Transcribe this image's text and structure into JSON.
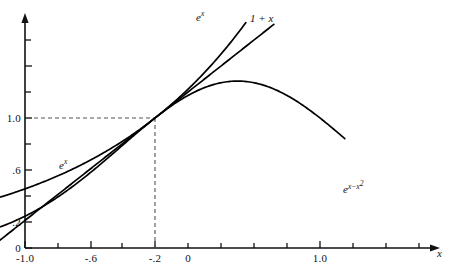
{
  "figure": {
    "background_color": "#ffffff",
    "axis_color": "#111111",
    "curve_color": "#000000",
    "guide_color": "#555555",
    "width": 451,
    "height": 272
  },
  "axes": {
    "x_axis_name": "x",
    "y_axis_name": "",
    "x_tick_labels": [
      "-1.0",
      "-.6",
      "-.2",
      "0",
      "1.0"
    ],
    "x_tick_values": [
      -1.0,
      -0.6,
      -0.2,
      0,
      1.0
    ],
    "x_minor_tick_values": [
      -0.8,
      -0.4,
      0.2,
      0.4,
      0.6,
      0.8,
      1.2,
      1.4
    ],
    "y_tick_labels": [
      "0",
      ".2",
      ".6",
      "1.0"
    ],
    "y_tick_values": [
      0,
      0.2,
      0.6,
      1.0
    ],
    "y_minor_tick_values": [
      0.4,
      0.8,
      1.2,
      1.4
    ]
  },
  "guides": {
    "horizontal_value": 1.0,
    "vertical_value": 0,
    "style": "dashed",
    "description": "dashed lines from y=1.0 on the y-axis to the point (0, 1) and down to x=0"
  },
  "curve_labels": {
    "exp_top": "e",
    "exp_top_sup": "x",
    "linear": "1 + x",
    "exp_left": "e",
    "exp_left_sup": "x",
    "gaussian_base": "e",
    "gaussian_sup_a": "x",
    "gaussian_sup_minus": "−",
    "gaussian_sup_b": "x",
    "gaussian_sup_b_pow": "2"
  },
  "chart_data": {
    "type": "line",
    "title": "",
    "xlabel": "x",
    "ylabel": "",
    "xlim": [
      -1.08,
      1.72
    ],
    "ylim": [
      -0.06,
      1.78
    ],
    "grid": false,
    "legend": "inline curve labels",
    "annotations": [
      {
        "text": "e^x",
        "x": 0.58,
        "y": 1.72,
        "role": "label for exponential curve upper branch"
      },
      {
        "text": "1 + x",
        "x": 0.92,
        "y": 1.7,
        "role": "label for tangent line"
      },
      {
        "text": "e^x",
        "x": -0.62,
        "y": 0.62,
        "role": "label for exponential curve lower branch"
      },
      {
        "text": "e^(x - x^2)",
        "x": 1.18,
        "y": 0.43,
        "role": "label for hump curve"
      }
    ],
    "series": [
      {
        "name": "e^x",
        "expression": "exp(x)",
        "x": [
          -1.0,
          -0.9,
          -0.8,
          -0.7,
          -0.6,
          -0.5,
          -0.4,
          -0.3,
          -0.2,
          -0.1,
          0.0,
          0.1,
          0.2,
          0.3,
          0.4,
          0.5,
          0.55
        ],
        "values": [
          0.368,
          0.407,
          0.449,
          0.497,
          0.549,
          0.607,
          0.67,
          0.741,
          0.819,
          0.905,
          1.0,
          1.105,
          1.221,
          1.35,
          1.492,
          1.649,
          1.733
        ]
      },
      {
        "name": "1 + x",
        "expression": "1 + x",
        "x": [
          -1.0,
          -0.5,
          0.0,
          0.5,
          0.72
        ],
        "values": [
          0.0,
          0.5,
          1.0,
          1.5,
          1.72
        ]
      },
      {
        "name": "e^(x - x^2)",
        "expression": "exp(x - x*x)",
        "x": [
          -1.0,
          -0.9,
          -0.8,
          -0.7,
          -0.6,
          -0.5,
          -0.4,
          -0.3,
          -0.2,
          -0.1,
          0.0,
          0.1,
          0.2,
          0.3,
          0.4,
          0.5,
          0.6,
          0.7,
          0.8,
          0.9,
          1.0,
          1.1,
          1.15
        ],
        "values": [
          0.135,
          0.154,
          0.198,
          0.251,
          0.313,
          0.472,
          0.497,
          0.67,
          0.787,
          0.896,
          1.0,
          1.094,
          1.174,
          1.234,
          1.271,
          1.284,
          1.271,
          1.234,
          1.174,
          1.094,
          1.0,
          0.896,
          0.846
        ]
      }
    ]
  }
}
